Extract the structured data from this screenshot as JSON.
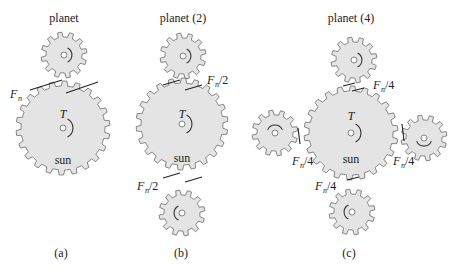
{
  "figure": {
    "panels": [
      {
        "id": "a",
        "caption": "(a)",
        "planet_label": "planet",
        "sun_label": "sun",
        "torque_label": "T",
        "force_labels": [
          {
            "main": "F",
            "sub": "n",
            "suffix": ""
          }
        ]
      },
      {
        "id": "b",
        "caption": "(b)",
        "planet_label": "planet (2)",
        "sun_label": "sun",
        "torque_label": "T",
        "force_labels": [
          {
            "main": "F",
            "sub": "n",
            "suffix": "/2"
          },
          {
            "main": "F",
            "sub": "n",
            "suffix": "/2"
          }
        ]
      },
      {
        "id": "c",
        "caption": "(c)",
        "planet_label": "planet (4)",
        "sun_label": "sun",
        "torque_label": "T",
        "force_labels": [
          {
            "main": "F",
            "sub": "n",
            "suffix": "/4"
          },
          {
            "main": "F",
            "sub": "n",
            "suffix": "/4"
          },
          {
            "main": "F",
            "sub": "n",
            "suffix": "/4"
          },
          {
            "main": "F",
            "sub": "n",
            "suffix": "/4"
          }
        ]
      }
    ],
    "colors": {
      "gear_fill": "#e4e4e4",
      "gear_stroke": "#6b6b6b",
      "line": "#222222"
    }
  }
}
